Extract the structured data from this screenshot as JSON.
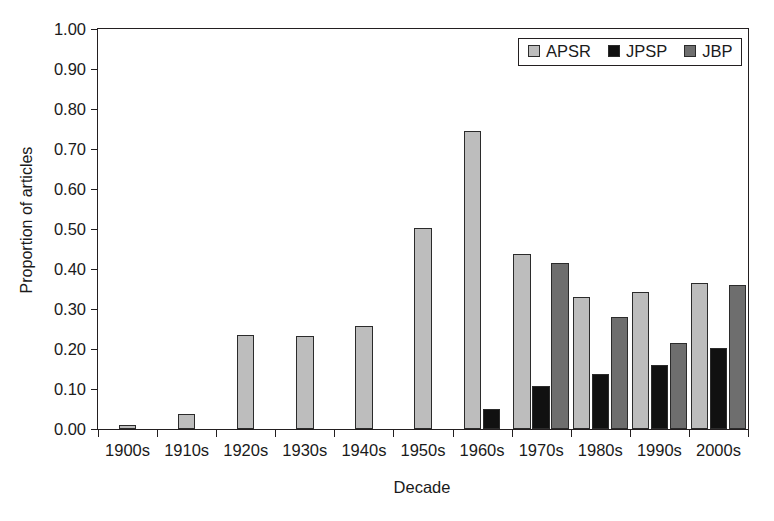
{
  "chart_data": {
    "type": "bar",
    "title": "",
    "xlabel": "Decade",
    "ylabel": "Proportion of articles",
    "ylim": [
      0.0,
      1.0
    ],
    "ytick_labels": [
      "0.00",
      "0.10",
      "0.20",
      "0.30",
      "0.40",
      "0.50",
      "0.60",
      "0.70",
      "0.80",
      "0.90",
      "1.00"
    ],
    "ytick_values": [
      0.0,
      0.1,
      0.2,
      0.3,
      0.4,
      0.5,
      0.6,
      0.7,
      0.8,
      0.9,
      1.0
    ],
    "grid": false,
    "legend_position": "top-right",
    "categories": [
      "1900s",
      "1910s",
      "1920s",
      "1930s",
      "1940s",
      "1950s",
      "1960s",
      "1970s",
      "1980s",
      "1990s",
      "2000s"
    ],
    "series": [
      {
        "name": "APSR",
        "color": "#bdbdbd",
        "values": [
          0.01,
          0.038,
          0.235,
          0.232,
          0.258,
          0.503,
          0.745,
          0.437,
          0.33,
          0.342,
          0.365
        ]
      },
      {
        "name": "JPSP",
        "color": "#111111",
        "values": [
          0.0,
          0.0,
          0.0,
          0.0,
          0.0,
          0.0,
          0.05,
          0.107,
          0.137,
          0.16,
          0.203
        ]
      },
      {
        "name": "JBP",
        "color": "#6e6e6e",
        "values": [
          0.0,
          0.0,
          0.0,
          0.0,
          0.0,
          0.0,
          0.0,
          0.415,
          0.28,
          0.216,
          0.36
        ]
      }
    ]
  },
  "legend": {
    "items": [
      {
        "label": "APSR",
        "swatch": "apsr"
      },
      {
        "label": "JPSP",
        "swatch": "jpsp"
      },
      {
        "label": "JBP",
        "swatch": "jbp"
      }
    ]
  }
}
